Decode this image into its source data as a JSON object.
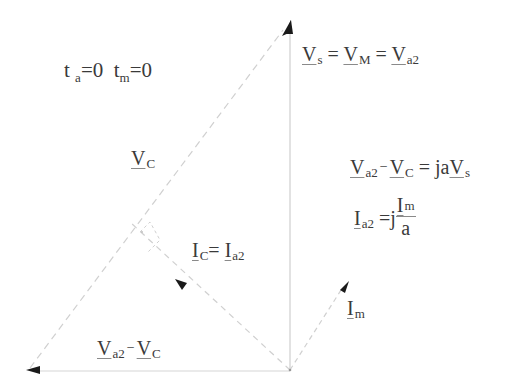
{
  "diagram": {
    "type": "phasor-diagram",
    "condition": {
      "ta_label": "t",
      "ta_sub": "a",
      "ta_eq": "=0",
      "tm_label": "t",
      "tm_sub": "m",
      "tm_eq": "=0"
    },
    "labels": {
      "vs_eq": {
        "v1": "V",
        "s1": "s",
        "eq1": " = ",
        "v2": "V",
        "s2": "M",
        "eq2": " = ",
        "v3": "V",
        "s3": "a2"
      },
      "vc": {
        "v": "V",
        "s": "C"
      },
      "va2_minus_vc_eq": {
        "v1": "V",
        "s1": "a2",
        "minus": "−",
        "v2": "V",
        "s2": "C",
        "eq": " = ja",
        "v3": "V",
        "s3": "s"
      },
      "ia2_eq": {
        "i": "I",
        "s": "a2",
        "eq": " =j",
        "num_i": "I",
        "num_s": "m",
        "den": "a"
      },
      "ic_eq": {
        "i1": "I",
        "s1": "C",
        "eq": "= ",
        "i2": "I",
        "s2": "a2"
      },
      "im": {
        "i": "I",
        "s": "m"
      },
      "bottom": {
        "v1": "V",
        "s1": "a2",
        "minus": "−",
        "v2": "V",
        "s2": "C"
      }
    },
    "colors": {
      "line": "#c8c8c8",
      "dash": "#cfcfcf",
      "arrow": "#1a1a1a",
      "text": "#3a3a3a"
    }
  }
}
